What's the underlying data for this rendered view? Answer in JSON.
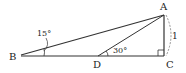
{
  "diagram": {
    "type": "geometry",
    "points": {
      "A": {
        "label": "A"
      },
      "B": {
        "label": "B"
      },
      "C": {
        "label": "C"
      },
      "D": {
        "label": "D"
      }
    },
    "angles": {
      "ABC": "15°",
      "ADC": "30°"
    },
    "segments": {
      "AC": "1"
    },
    "right_angle_at": "C"
  }
}
